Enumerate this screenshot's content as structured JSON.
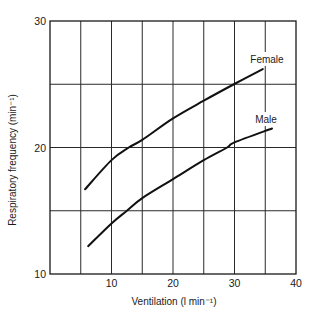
{
  "chart_data": {
    "type": "line",
    "title": "",
    "xlabel": "Ventilation (l min⁻¹)",
    "ylabel": "Respiratory frequency (min⁻¹)",
    "xlim": [
      0,
      40
    ],
    "ylim": [
      10,
      30
    ],
    "xticks": [
      10,
      20,
      30,
      40
    ],
    "yticks": [
      10,
      20,
      30
    ],
    "grid": {
      "x_step": 5,
      "y_step": 5,
      "on": true
    },
    "legend": "inline labels at line ends",
    "series": [
      {
        "name": "Female",
        "x": [
          5.7,
          10,
          12.8,
          15,
          20,
          25,
          29.9,
          34.6
        ],
        "y": [
          16.7,
          19.0,
          20.0,
          20.6,
          22.3,
          23.7,
          25.0,
          26.2
        ]
      },
      {
        "name": "Male",
        "x": [
          6.2,
          10,
          12.5,
          15,
          20,
          25,
          28.8,
          30,
          36.1
        ],
        "y": [
          12.2,
          14.0,
          15.0,
          16.0,
          17.5,
          19.0,
          20.0,
          20.4,
          21.5
        ]
      }
    ]
  },
  "labels": {
    "xlabel": "Ventilation (l min⁻¹)",
    "ylabel": "Respiratory frequency (min⁻¹)",
    "female": "Female",
    "male": "Male",
    "xticks": [
      "10",
      "20",
      "30",
      "40"
    ],
    "yticks": [
      "10",
      "20",
      "30"
    ]
  }
}
